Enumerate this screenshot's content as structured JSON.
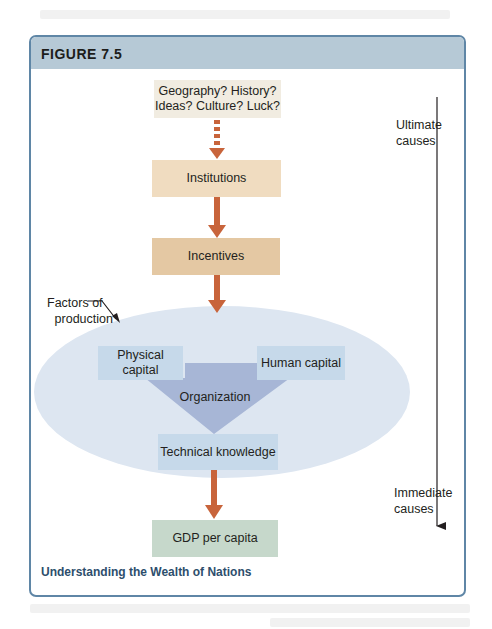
{
  "figure": {
    "label": "FIGURE 7.5",
    "caption": "Understanding the Wealth of Nations"
  },
  "nodes": {
    "ultimate_sources": {
      "line1": "Geography? History?",
      "line2": "Ideas? Culture? Luck?"
    },
    "institutions": "Institutions",
    "incentives": "Incentives",
    "physical_capital": "Physical capital",
    "human_capital": "Human capital",
    "organization": "Organization",
    "technical_knowledge": "Technical knowledge",
    "gdp_per_capita": "GDP per capita"
  },
  "annotations": {
    "factors_of_production": {
      "line1": "Factors of",
      "line2": "production"
    },
    "ultimate_causes": {
      "line1": "Ultimate",
      "line2": "causes"
    },
    "immediate_causes": {
      "line1": "Immediate",
      "line2": "causes"
    }
  },
  "colors": {
    "frame": "#5f86a6",
    "header": "#b6c9d6",
    "arrow": "#c8643b",
    "ellipse": "#dde6f1",
    "triangle": "#a7b6d6",
    "caption": "#2d4e6c"
  }
}
